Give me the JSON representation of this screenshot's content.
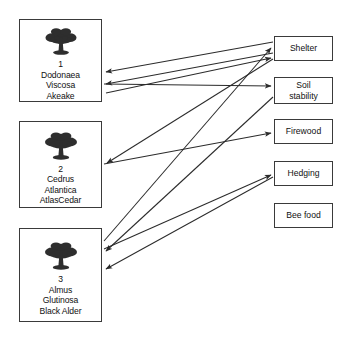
{
  "diagram": {
    "background_color": "#ffffff",
    "line_color": "#2b2b2b",
    "border_color": "#3a3a3a",
    "species_nodes": [
      {
        "id": "species-1",
        "icon": "tree-icon",
        "number": "1",
        "genus": "Dodonaea",
        "species": "Viscosa",
        "common_name": "Akeake",
        "box": {
          "x": 19,
          "y": 19,
          "w": 83,
          "h": 83
        }
      },
      {
        "id": "species-2",
        "icon": "tree-icon",
        "number": "2",
        "genus": "Cedrus",
        "species": "Atlantica",
        "common_name": "AtlasCedar",
        "box": {
          "x": 19,
          "y": 121,
          "w": 83,
          "h": 87
        }
      },
      {
        "id": "species-3",
        "icon": "tree-icon",
        "number": "3",
        "genus": "Almus",
        "species": "Glutinosa",
        "common_name": "Black Alder",
        "box": {
          "x": 19,
          "y": 228,
          "w": 83,
          "h": 94
        }
      }
    ],
    "use_nodes": [
      {
        "id": "use-shelter",
        "lines": [
          "Shelter"
        ],
        "box": {
          "x": 274,
          "y": 36,
          "w": 59,
          "h": 25
        }
      },
      {
        "id": "use-soil-stability",
        "lines": [
          "Soil",
          "stability"
        ],
        "box": {
          "x": 274,
          "y": 77,
          "w": 59,
          "h": 27
        }
      },
      {
        "id": "use-firewood",
        "lines": [
          "Firewood"
        ],
        "box": {
          "x": 274,
          "y": 119,
          "w": 59,
          "h": 25
        }
      },
      {
        "id": "use-hedging",
        "lines": [
          "Hedging"
        ],
        "box": {
          "x": 274,
          "y": 161,
          "w": 59,
          "h": 25
        }
      },
      {
        "id": "use-bee-food",
        "lines": [
          "Bee food"
        ],
        "box": {
          "x": 274,
          "y": 203,
          "w": 59,
          "h": 25
        }
      }
    ],
    "links": [
      {
        "from": "use-shelter",
        "to": "species-1",
        "x1": 273,
        "y1": 42,
        "x2": 104,
        "y2": 72
      },
      {
        "from": "use-shelter",
        "to": "species-1",
        "x1": 273,
        "y1": 52,
        "x2": 104,
        "y2": 84
      },
      {
        "from": "species-1",
        "to": "use-soil-stability",
        "x1": 104,
        "y1": 84,
        "x2": 273,
        "y2": 85
      },
      {
        "from": "use-shelter",
        "to": "species-2",
        "x1": 273,
        "y1": 58,
        "x2": 105,
        "y2": 163
      },
      {
        "from": "species-2",
        "to": "use-firewood",
        "x1": 104,
        "y1": 163,
        "x2": 273,
        "y2": 134
      },
      {
        "from": "species-3",
        "to": "use-shelter",
        "x1": 104,
        "y1": 240,
        "x2": 273,
        "y2": 46
      },
      {
        "from": "use-soil-stability",
        "to": "species-3",
        "x1": 273,
        "y1": 98,
        "x2": 104,
        "y2": 250
      },
      {
        "from": "use-hedging",
        "to": "species-3",
        "x1": 273,
        "y1": 176,
        "x2": 104,
        "y2": 268
      },
      {
        "from": "species-3",
        "to": "use-hedging",
        "x1": 104,
        "y1": 250,
        "x2": 273,
        "y2": 176
      },
      {
        "from": "species-1",
        "to": "use-shelter",
        "x1": 104,
        "y1": 93,
        "x2": 273,
        "y2": 57
      }
    ]
  }
}
